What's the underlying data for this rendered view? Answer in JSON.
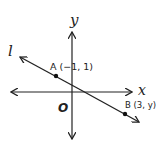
{
  "diagram": {
    "type": "coordinate-plane",
    "axes": {
      "x_label": "x",
      "y_label": "y",
      "origin_label": "O"
    },
    "line": {
      "label": "l"
    },
    "points": [
      {
        "name": "A",
        "label": "A (−1, 1)"
      },
      {
        "name": "B",
        "label": "B (3, y)"
      }
    ]
  }
}
